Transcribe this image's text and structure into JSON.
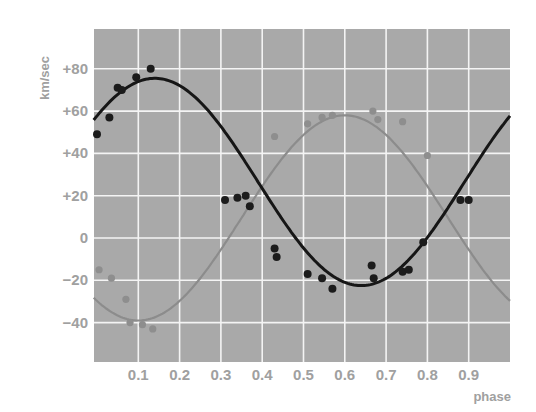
{
  "chart_data": {
    "type": "scatter",
    "title": "",
    "xlabel": "phase",
    "ylabel": "km/sec",
    "xlim": [
      0,
      1
    ],
    "ylim": [
      -60,
      94
    ],
    "grid": true,
    "legend": null,
    "x_ticks": [
      0.1,
      0.2,
      0.3,
      0.4,
      0.5,
      0.6,
      0.7,
      0.8,
      0.9
    ],
    "x_tick_labels": [
      "0.1",
      "0.2",
      "0.3",
      "0.4",
      "0.5",
      "0.6",
      "0.7",
      "0.8",
      "0.9"
    ],
    "y_ticks": [
      80,
      60,
      40,
      20,
      0,
      -20,
      -40
    ],
    "y_tick_labels": [
      "+80",
      "+60",
      "+40",
      "+20",
      "0",
      "−20",
      "−40"
    ],
    "series": [
      {
        "name": "primary (black)",
        "color": "#1a1a1a",
        "curve": {
          "type": "sinusoid",
          "center": 26.5,
          "amplitude": 49,
          "peak_phase": 0.14
        },
        "points": [
          [
            0.0,
            49
          ],
          [
            0.03,
            57
          ],
          [
            0.05,
            71
          ],
          [
            0.06,
            70
          ],
          [
            0.095,
            76
          ],
          [
            0.13,
            80
          ],
          [
            0.31,
            18
          ],
          [
            0.34,
            19
          ],
          [
            0.36,
            20
          ],
          [
            0.37,
            15
          ],
          [
            0.43,
            -5
          ],
          [
            0.435,
            -9
          ],
          [
            0.51,
            -17
          ],
          [
            0.545,
            -19
          ],
          [
            0.57,
            -24
          ],
          [
            0.665,
            -13
          ],
          [
            0.67,
            -19
          ],
          [
            0.74,
            -16
          ],
          [
            0.755,
            -15
          ],
          [
            0.79,
            -2
          ],
          [
            0.88,
            18
          ],
          [
            0.9,
            18
          ]
        ]
      },
      {
        "name": "secondary (gray)",
        "color": "#8a8a8a",
        "curve": {
          "type": "sinusoid",
          "center": 9.5,
          "amplitude": 48.5,
          "peak_phase": 0.6
        },
        "points": [
          [
            0.005,
            -15
          ],
          [
            0.035,
            -19
          ],
          [
            0.07,
            -29
          ],
          [
            0.08,
            -40
          ],
          [
            0.11,
            -41
          ],
          [
            0.135,
            -43
          ],
          [
            0.43,
            48
          ],
          [
            0.51,
            54
          ],
          [
            0.545,
            57
          ],
          [
            0.57,
            58
          ],
          [
            0.668,
            60
          ],
          [
            0.68,
            56
          ],
          [
            0.74,
            55
          ],
          [
            0.8,
            39
          ]
        ]
      }
    ]
  }
}
